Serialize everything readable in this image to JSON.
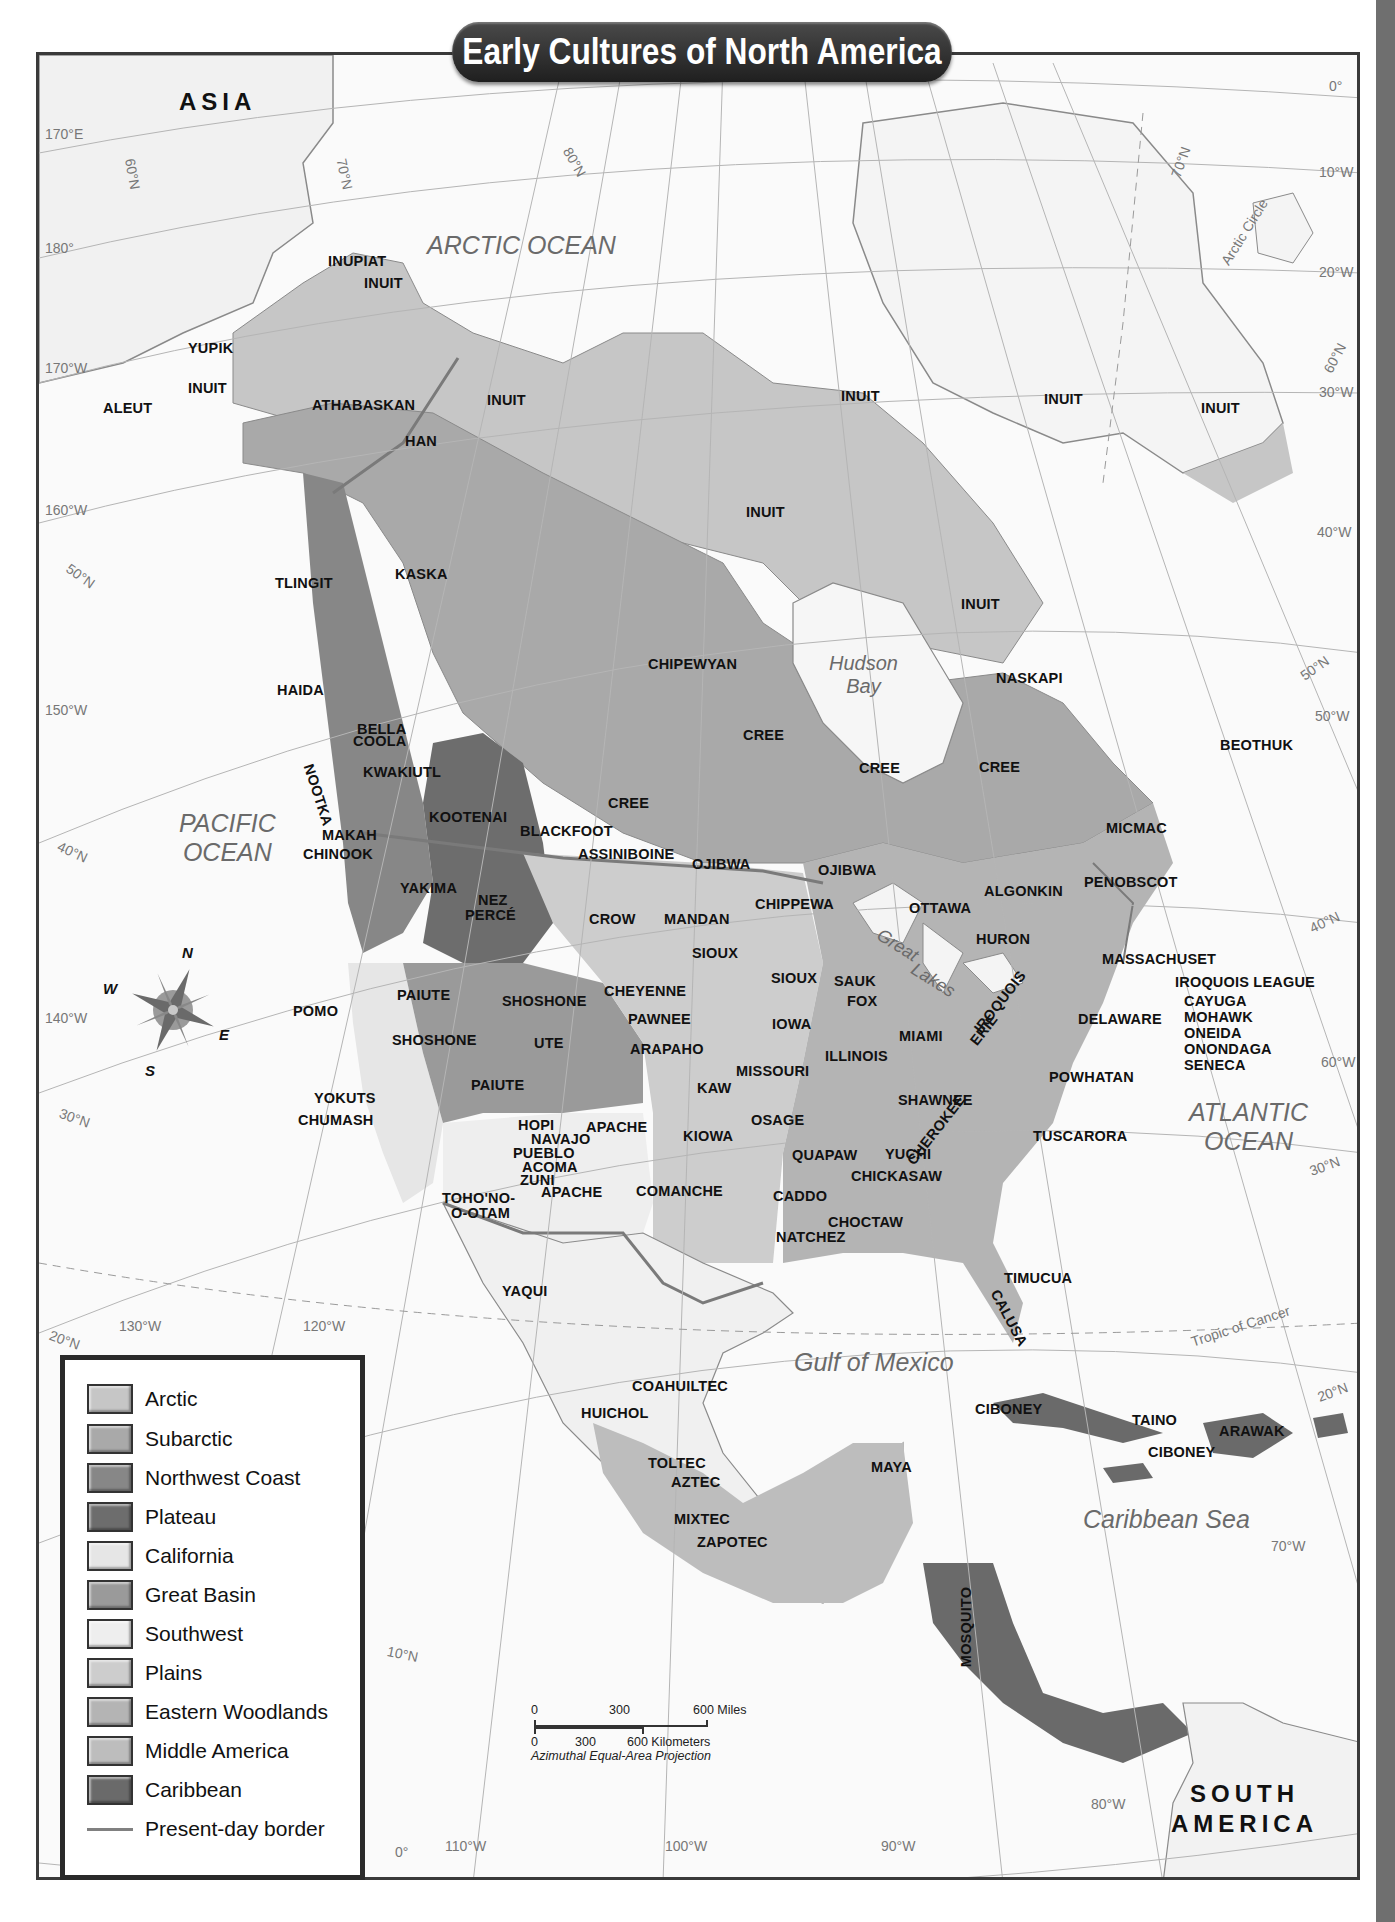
{
  "title": "Early Cultures of North America",
  "continents": {
    "asia": "ASIA",
    "south_america_line1": "SOUTH",
    "south_america_line2": "AMERICA"
  },
  "water_bodies": {
    "arctic_ocean": "ARCTIC OCEAN",
    "pacific_line1": "PACIFIC",
    "pacific_line2": "OCEAN",
    "atlantic_line1": "ATLANTIC",
    "atlantic_line2": "OCEAN",
    "hudson_line1": "Hudson",
    "hudson_line2": "Bay",
    "gulf_of_mexico": "Gulf of Mexico",
    "caribbean_sea": "Caribbean Sea",
    "great_lakes_1": "Great",
    "great_lakes_2": "Lakes"
  },
  "grid_labels": {
    "lon_170e": "170°E",
    "lon_180": "180°",
    "lon_170w": "170°W",
    "lon_160w": "160°W",
    "lon_150w": "150°W",
    "lon_140w": "140°W",
    "lon_130w": "130°W",
    "lon_120w": "120°W",
    "lon_110w": "110°W",
    "lon_100w": "100°W",
    "lon_90w": "90°W",
    "lon_80w": "80°W",
    "lon_70w": "70°W",
    "lon_60w": "60°W",
    "lon_50w": "50°W",
    "lon_40w": "40°W",
    "lon_30w": "30°W",
    "lon_20w": "20°W",
    "lon_10w": "10°W",
    "lon_0": "0°",
    "lat_0": "0°",
    "lat_10n": "10°N",
    "lat_20n_w": "20°N",
    "lat_20n_e": "20°N",
    "lat_30n_w": "30°N",
    "lat_30n_e": "30°N",
    "lat_40n_w": "40°N",
    "lat_40n_e": "40°N",
    "lat_50n_w": "50°N",
    "lat_50n_e": "50°N",
    "lat_60n_w": "60°N",
    "lat_60n_e": "60°N",
    "lat_70n_w": "70°N",
    "lat_70n_e": "70°N",
    "lat_80n": "80°N",
    "arctic_circle": "Arctic Circle",
    "tropic_of_cancer": "Tropic of Cancer"
  },
  "peoples": [
    {
      "name": "INUPIAT",
      "x": 328,
      "y": 262
    },
    {
      "name": "INUIT",
      "x": 364,
      "y": 284
    },
    {
      "name": "YUPIK",
      "x": 188,
      "y": 349
    },
    {
      "name": "INUIT",
      "x": 188,
      "y": 389
    },
    {
      "name": "ALEUT",
      "x": 103,
      "y": 409
    },
    {
      "name": "ATHABASKAN",
      "x": 312,
      "y": 406
    },
    {
      "name": "HAN",
      "x": 405,
      "y": 442
    },
    {
      "name": "INUIT",
      "x": 487,
      "y": 401
    },
    {
      "name": "INUIT",
      "x": 841,
      "y": 397
    },
    {
      "name": "INUIT",
      "x": 1044,
      "y": 400
    },
    {
      "name": "INUIT",
      "x": 1201,
      "y": 409
    },
    {
      "name": "INUIT",
      "x": 746,
      "y": 513
    },
    {
      "name": "INUIT",
      "x": 961,
      "y": 605
    },
    {
      "name": "KASKA",
      "x": 395,
      "y": 575
    },
    {
      "name": "TLINGIT",
      "x": 275,
      "y": 584
    },
    {
      "name": "HAIDA",
      "x": 277,
      "y": 691
    },
    {
      "name": "CHIPEWYAN",
      "x": 648,
      "y": 665
    },
    {
      "name": "NASKAPI",
      "x": 996,
      "y": 679
    },
    {
      "name": "CREE",
      "x": 743,
      "y": 736
    },
    {
      "name": "CREE",
      "x": 859,
      "y": 769
    },
    {
      "name": "CREE",
      "x": 979,
      "y": 768
    },
    {
      "name": "CREE",
      "x": 608,
      "y": 804
    },
    {
      "name": "BEOTHUK",
      "x": 1220,
      "y": 746
    },
    {
      "name": "BELLA",
      "x": 357,
      "y": 730
    },
    {
      "name": "COOLA",
      "x": 353,
      "y": 742
    },
    {
      "name": "KWAKIUTL",
      "x": 363,
      "y": 773
    },
    {
      "name": "KOOTENAI",
      "x": 429,
      "y": 818
    },
    {
      "name": "BLACKFOOT",
      "x": 520,
      "y": 832
    },
    {
      "name": "MAKAH",
      "x": 322,
      "y": 836
    },
    {
      "name": "CHINOOK",
      "x": 303,
      "y": 855
    },
    {
      "name": "ASSINIBOINE",
      "x": 578,
      "y": 855
    },
    {
      "name": "OJIBWA",
      "x": 692,
      "y": 865
    },
    {
      "name": "OJIBWA",
      "x": 818,
      "y": 871
    },
    {
      "name": "MICMAC",
      "x": 1106,
      "y": 829
    },
    {
      "name": "YAKIMA",
      "x": 400,
      "y": 889
    },
    {
      "name": "NEZ",
      "x": 478,
      "y": 901
    },
    {
      "name": "PERCÉ",
      "x": 465,
      "y": 916
    },
    {
      "name": "CROW",
      "x": 589,
      "y": 920
    },
    {
      "name": "MANDAN",
      "x": 664,
      "y": 920
    },
    {
      "name": "CHIPPEWA",
      "x": 755,
      "y": 905
    },
    {
      "name": "ALGONKIN",
      "x": 984,
      "y": 892
    },
    {
      "name": "PENOBSCOT",
      "x": 1084,
      "y": 883
    },
    {
      "name": "OTTAWA",
      "x": 909,
      "y": 909
    },
    {
      "name": "HURON",
      "x": 976,
      "y": 940
    },
    {
      "name": "SIOUX",
      "x": 692,
      "y": 954
    },
    {
      "name": "SIOUX",
      "x": 771,
      "y": 979
    },
    {
      "name": "SAUK",
      "x": 834,
      "y": 982
    },
    {
      "name": "FOX",
      "x": 847,
      "y": 1002
    },
    {
      "name": "MASSACHUSET",
      "x": 1102,
      "y": 960
    },
    {
      "name": "IROQUOIS LEAGUE",
      "x": 1175,
      "y": 983
    },
    {
      "name": "CAYUGA",
      "x": 1184,
      "y": 1002
    },
    {
      "name": "MOHAWK",
      "x": 1184,
      "y": 1018
    },
    {
      "name": "ONEIDA",
      "x": 1184,
      "y": 1034
    },
    {
      "name": "ONONDAGA",
      "x": 1184,
      "y": 1050
    },
    {
      "name": "SENECA",
      "x": 1184,
      "y": 1066
    },
    {
      "name": "DELAWARE",
      "x": 1078,
      "y": 1020
    },
    {
      "name": "POMO",
      "x": 293,
      "y": 1012
    },
    {
      "name": "PAIUTE",
      "x": 397,
      "y": 996
    },
    {
      "name": "SHOSHONE",
      "x": 502,
      "y": 1002
    },
    {
      "name": "CHEYENNE",
      "x": 604,
      "y": 992
    },
    {
      "name": "PAWNEE",
      "x": 628,
      "y": 1020
    },
    {
      "name": "IOWA",
      "x": 772,
      "y": 1025
    },
    {
      "name": "MIAMI",
      "x": 899,
      "y": 1037
    },
    {
      "name": "SHOSHONE",
      "x": 392,
      "y": 1041
    },
    {
      "name": "UTE",
      "x": 534,
      "y": 1044
    },
    {
      "name": "ARAPAHO",
      "x": 630,
      "y": 1050
    },
    {
      "name": "ILLINOIS",
      "x": 825,
      "y": 1057
    },
    {
      "name": "MISSOURI",
      "x": 736,
      "y": 1072
    },
    {
      "name": "POWHATAN",
      "x": 1049,
      "y": 1078
    },
    {
      "name": "PAIUTE",
      "x": 471,
      "y": 1086
    },
    {
      "name": "KAW",
      "x": 697,
      "y": 1089
    },
    {
      "name": "YOKUTS",
      "x": 314,
      "y": 1099
    },
    {
      "name": "CHUMASH",
      "x": 298,
      "y": 1121
    },
    {
      "name": "SHAWNEE",
      "x": 898,
      "y": 1101
    },
    {
      "name": "HOPI",
      "x": 518,
      "y": 1126
    },
    {
      "name": "APACHE",
      "x": 586,
      "y": 1128
    },
    {
      "name": "OSAGE",
      "x": 751,
      "y": 1121
    },
    {
      "name": "NAVAJO",
      "x": 531,
      "y": 1140
    },
    {
      "name": "KIOWA",
      "x": 683,
      "y": 1137
    },
    {
      "name": "TUSCARORA",
      "x": 1033,
      "y": 1137
    },
    {
      "name": "PUEBLO",
      "x": 513,
      "y": 1154
    },
    {
      "name": "QUAPAW",
      "x": 792,
      "y": 1156
    },
    {
      "name": "YUCHI",
      "x": 885,
      "y": 1155
    },
    {
      "name": "ACOMA",
      "x": 522,
      "y": 1168
    },
    {
      "name": "ZUNI",
      "x": 520,
      "y": 1181
    },
    {
      "name": "CHICKASAW",
      "x": 851,
      "y": 1177
    },
    {
      "name": "TOHO'NO-",
      "x": 442,
      "y": 1199
    },
    {
      "name": "O-OTAM",
      "x": 451,
      "y": 1214
    },
    {
      "name": "APACHE",
      "x": 541,
      "y": 1193
    },
    {
      "name": "COMANCHE",
      "x": 636,
      "y": 1192
    },
    {
      "name": "CADDO",
      "x": 773,
      "y": 1197
    },
    {
      "name": "CHOCTAW",
      "x": 828,
      "y": 1223
    },
    {
      "name": "NATCHEZ",
      "x": 776,
      "y": 1238
    },
    {
      "name": "YAQUI",
      "x": 502,
      "y": 1292
    },
    {
      "name": "TIMUCUA",
      "x": 1004,
      "y": 1279
    },
    {
      "name": "COAHUILTEC",
      "x": 632,
      "y": 1387
    },
    {
      "name": "HUICHOL",
      "x": 581,
      "y": 1414
    },
    {
      "name": "CIBONEY",
      "x": 975,
      "y": 1410
    },
    {
      "name": "TAINO",
      "x": 1132,
      "y": 1421
    },
    {
      "name": "ARAWAK",
      "x": 1219,
      "y": 1432
    },
    {
      "name": "CIBONEY",
      "x": 1148,
      "y": 1453
    },
    {
      "name": "TOLTEC",
      "x": 648,
      "y": 1464
    },
    {
      "name": "AZTEC",
      "x": 671,
      "y": 1483
    },
    {
      "name": "MAYA",
      "x": 871,
      "y": 1468
    },
    {
      "name": "MIXTEC",
      "x": 674,
      "y": 1520
    },
    {
      "name": "ZAPOTEC",
      "x": 697,
      "y": 1543
    }
  ],
  "rotated_peoples": [
    {
      "name": "NOOTKA",
      "x": 318,
      "y": 795,
      "rotate": 72
    },
    {
      "name": "IROQUOIS",
      "x": 1000,
      "y": 1002,
      "rotate": -52
    },
    {
      "name": "ERIE",
      "x": 984,
      "y": 1030,
      "rotate": -52
    },
    {
      "name": "CHEROKEE",
      "x": 936,
      "y": 1130,
      "rotate": -52
    },
    {
      "name": "CALUSA",
      "x": 1009,
      "y": 1318,
      "rotate": 62
    },
    {
      "name": "MOSQUITO",
      "x": 966,
      "y": 1627,
      "rotate": -90
    }
  ],
  "legend": {
    "items": [
      {
        "label": "Arctic",
        "color": "#c6c6c6"
      },
      {
        "label": "Subarctic",
        "color": "#a9a9a9"
      },
      {
        "label": "Northwest Coast",
        "color": "#878787"
      },
      {
        "label": "Plateau",
        "color": "#6d6d6d"
      },
      {
        "label": "California",
        "color": "#e6e6e6"
      },
      {
        "label": "Great Basin",
        "color": "#9a9a9a"
      },
      {
        "label": "Southwest",
        "color": "#eeeeee"
      },
      {
        "label": "Plains",
        "color": "#cdcdcd"
      },
      {
        "label": "Eastern Woodlands",
        "color": "#b4b4b4"
      },
      {
        "label": "Middle America",
        "color": "#bdbdbd"
      },
      {
        "label": "Caribbean",
        "color": "#6a6a6a"
      }
    ],
    "border_label": "Present-day border",
    "border_color": "#808080"
  },
  "scale_bar": {
    "miles_0": "0",
    "miles_300": "300",
    "miles_600": "600 Miles",
    "km_0": "0",
    "km_300": "300",
    "km_600": "600 Kilometers",
    "projection": "Azimuthal Equal-Area Projection"
  },
  "compass": {
    "n": "N",
    "s": "S",
    "e": "E",
    "w": "W"
  },
  "colors": {
    "ocean": "#fafafa",
    "land_unshaded": "#f2f2f2",
    "title_bg": "#2c2c2c",
    "frame": "#3a3a3a",
    "side_strip": "#6f6f6f"
  }
}
